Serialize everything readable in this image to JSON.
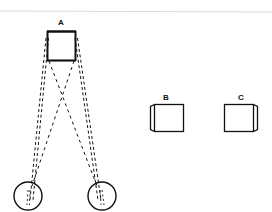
{
  "diagram": {
    "type": "binocular-vision-figure",
    "colors": {
      "stroke": "#111111",
      "background": "#ffffff",
      "rule": "#dcdcdc"
    },
    "objects": [
      {
        "id": "A",
        "label": "A",
        "description": "cube viewed by both eyes"
      },
      {
        "id": "B",
        "label": "B",
        "description": "cube as seen by left eye (left side face visible)"
      },
      {
        "id": "C",
        "label": "C",
        "description": "cube as seen by right eye (right side face visible)"
      }
    ],
    "eyes": [
      {
        "id": "left-eye"
      },
      {
        "id": "right-eye"
      }
    ],
    "sight_lines": [
      {
        "from": "A",
        "to": "left-eye",
        "style": "double-dashed",
        "side": "outer"
      },
      {
        "from": "A",
        "to": "right-eye",
        "style": "double-dashed",
        "side": "outer"
      },
      {
        "from": "A",
        "to": "right-eye",
        "style": "dashed",
        "side": "crossing"
      },
      {
        "from": "A",
        "to": "left-eye",
        "style": "dashed",
        "side": "crossing"
      }
    ]
  }
}
